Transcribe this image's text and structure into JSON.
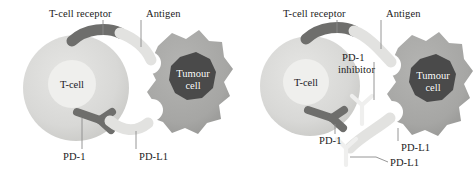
{
  "figure": {
    "type": "biomedical-schematic",
    "background_color": "#ffffff",
    "panel_count": 2
  },
  "palette": {
    "tcell_body": "#d9d9d7",
    "tcell_nucleus": "#efefed",
    "tumour_body": "#a9a9a7",
    "tumour_nucleus": "#4a4a4a",
    "receptor_dark": "#6e6e6c",
    "ligand_light": "#e2e2e0",
    "antibody_light": "#efefee",
    "leader_line": "#8a8a8a",
    "text": "#1b1b1b",
    "text_on_dark": "#ffffff"
  },
  "panels": [
    {
      "id": "panel-left",
      "name": "binding",
      "caption": "",
      "labels": {
        "tcell_receptor": "T-cell receptor",
        "antigen": "Antigen",
        "tcell": "T-cell",
        "tumour_cell": "Tumour\ncell",
        "tumour_cell_line1": "Tumour",
        "tumour_cell_line2": "cell",
        "pd1": "PD-1",
        "pdl1": "PD-L1"
      }
    },
    {
      "id": "panel-right",
      "name": "blockade",
      "caption": "",
      "labels": {
        "tcell_receptor": "T-cell receptor",
        "antigen": "Antigen",
        "tcell": "T-cell",
        "tumour_cell_line1": "Tumour",
        "tumour_cell_line2": "cell",
        "pd1_inhibitor_line1": "PD-1",
        "pd1_inhibitor_line2": "inhibitor",
        "pd1": "PD-1",
        "pdl1_ligand": "PD-L1",
        "pdl1_inhibitor": "PD-L1"
      }
    }
  ]
}
